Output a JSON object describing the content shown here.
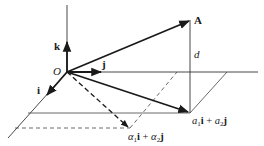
{
  "diagram": {
    "type": "vector-decomposition-3d",
    "labels": {
      "origin": "O",
      "unit_k": "k",
      "unit_j": "j",
      "unit_i": "i",
      "vector_A": "A",
      "distance": "d",
      "projection": {
        "coef1": "a",
        "sub1": "1",
        "vec1": "i",
        "plus": " + ",
        "coef2": "a",
        "sub2": "2",
        "vec2": "j"
      },
      "alt_projection": {
        "coef1": "α",
        "sub1": "1",
        "vec1": "i",
        "plus": " + ",
        "coef2": "α",
        "sub2": "2",
        "vec2": "j"
      }
    },
    "colors": {
      "stroke": "#1a1a1a",
      "thin_stroke": "#444444",
      "background": "#ffffff"
    }
  }
}
